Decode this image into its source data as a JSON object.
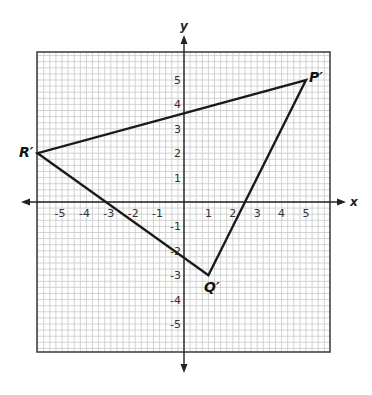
{
  "figure": {
    "type": "coordinate-plane-triangle",
    "axes": {
      "x_label": "x",
      "y_label": "y",
      "x_ticks": [
        "-5",
        "-4",
        "-3",
        "-2",
        "-1",
        "1",
        "2",
        "3",
        "4",
        "5"
      ],
      "y_ticks": [
        "5",
        "4",
        "3",
        "2",
        "1",
        "-1",
        "-2",
        "-3",
        "-4",
        "-5"
      ],
      "x_range": [
        -6,
        6
      ],
      "y_range": [
        -6,
        6
      ],
      "grid_minor_per_unit": 4
    },
    "triangle": {
      "vertices": [
        {
          "label": "P′",
          "x": 5,
          "y": 5
        },
        {
          "label": "Q′",
          "x": 1,
          "y": -3
        },
        {
          "label": "R′",
          "x": -6,
          "y": 2
        }
      ]
    },
    "colors": {
      "grid_minor": "#c8c8c8",
      "grid_border": "#444444",
      "axis": "#222222",
      "triangle": "#1a1a1a"
    }
  }
}
